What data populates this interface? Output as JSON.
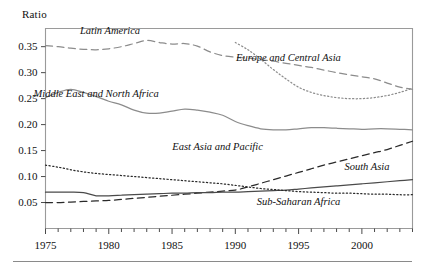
{
  "axis_title": "Ratio",
  "chart_data": {
    "type": "line",
    "title": "",
    "xlabel": "",
    "ylabel": "Ratio",
    "xlim": [
      1975,
      2004
    ],
    "ylim": [
      0.0,
      0.385
    ],
    "yticks": [
      0.05,
      0.1,
      0.15,
      0.2,
      0.25,
      0.3,
      0.35
    ],
    "ytick_labels": [
      "0.05",
      "0.10",
      "0.15",
      "0.20",
      "0.25",
      "0.30",
      "0.35"
    ],
    "xticks": [
      1975,
      1980,
      1985,
      1990,
      1995,
      2000
    ],
    "xtick_labels": [
      "1975",
      "1980",
      "1985",
      "1990",
      "1995",
      "2000"
    ],
    "minor_xticks_every": 1,
    "grid": false,
    "legend": "inline-annotations",
    "series": [
      {
        "name": "Latin America",
        "style": "dashed",
        "color": "#8c8c8c",
        "label_pos": {
          "x": 1980.1,
          "y": 0.374
        },
        "x": [
          1975,
          1976,
          1977,
          1978,
          1979,
          1980,
          1981,
          1982,
          1983,
          1984,
          1985,
          1986,
          1987,
          1988,
          1989,
          1990,
          1991,
          1992,
          1993,
          1994,
          1995,
          1996,
          1997,
          1998,
          1999,
          2000,
          2001,
          2002,
          2003,
          2004
        ],
        "values": [
          0.352,
          0.35,
          0.347,
          0.345,
          0.344,
          0.346,
          0.35,
          0.356,
          0.362,
          0.358,
          0.355,
          0.356,
          0.351,
          0.34,
          0.333,
          0.33,
          0.328,
          0.325,
          0.322,
          0.318,
          0.314,
          0.31,
          0.305,
          0.3,
          0.296,
          0.292,
          0.288,
          0.28,
          0.272,
          0.268
        ]
      },
      {
        "name": "Middle East and North Africa",
        "style": "solid",
        "color": "#8c8c8c",
        "label_pos": {
          "x": 1979.0,
          "y": 0.253
        },
        "x": [
          1975,
          1976,
          1977,
          1978,
          1979,
          1980,
          1981,
          1982,
          1983,
          1984,
          1985,
          1986,
          1987,
          1988,
          1989,
          1990,
          1991,
          1992,
          1993,
          1994,
          1995,
          1996,
          1997,
          1998,
          1999,
          2000,
          2001,
          2002,
          2003,
          2004
        ],
        "values": [
          0.252,
          0.262,
          0.268,
          0.262,
          0.254,
          0.245,
          0.238,
          0.228,
          0.222,
          0.222,
          0.226,
          0.23,
          0.228,
          0.224,
          0.218,
          0.206,
          0.198,
          0.192,
          0.19,
          0.19,
          0.192,
          0.194,
          0.194,
          0.193,
          0.192,
          0.191,
          0.192,
          0.192,
          0.191,
          0.19
        ]
      },
      {
        "name": "Europe and Central Asia",
        "style": "dotted",
        "color": "#8c8c8c",
        "label_pos": {
          "x": 1994.2,
          "y": 0.322
        },
        "x": [
          1990,
          1991,
          1992,
          1993,
          1994,
          1995,
          1996,
          1997,
          1998,
          1999,
          2000,
          2001,
          2002,
          2003,
          2004
        ],
        "values": [
          0.358,
          0.344,
          0.326,
          0.306,
          0.288,
          0.272,
          0.262,
          0.256,
          0.252,
          0.25,
          0.25,
          0.252,
          0.256,
          0.262,
          0.27
        ]
      },
      {
        "name": "East Asia and Pacific",
        "style": "dashed",
        "color": "#2a2a2a",
        "label_pos": {
          "x": 1988.6,
          "y": 0.152
        },
        "x": [
          1975,
          1976,
          1977,
          1978,
          1979,
          1980,
          1981,
          1982,
          1983,
          1984,
          1985,
          1986,
          1987,
          1988,
          1989,
          1990,
          1991,
          1992,
          1993,
          1994,
          1995,
          1996,
          1997,
          1998,
          1999,
          2000,
          2001,
          2002,
          2003,
          2004
        ],
        "values": [
          0.05,
          0.05,
          0.051,
          0.052,
          0.053,
          0.054,
          0.056,
          0.058,
          0.06,
          0.062,
          0.064,
          0.066,
          0.068,
          0.07,
          0.072,
          0.074,
          0.08,
          0.087,
          0.094,
          0.101,
          0.108,
          0.115,
          0.122,
          0.128,
          0.134,
          0.14,
          0.146,
          0.152,
          0.16,
          0.168
        ]
      },
      {
        "name": "South Asia",
        "style": "solid",
        "color": "#4a4a4a",
        "label_pos": {
          "x": 2000.4,
          "y": 0.113
        },
        "x": [
          1975,
          1976,
          1977,
          1978,
          1979,
          1980,
          1981,
          1982,
          1983,
          1984,
          1985,
          1986,
          1987,
          1988,
          1989,
          1990,
          1991,
          1992,
          1993,
          1994,
          1995,
          1996,
          1997,
          1998,
          1999,
          2000,
          2001,
          2002,
          2003,
          2004
        ],
        "values": [
          0.07,
          0.07,
          0.07,
          0.069,
          0.063,
          0.063,
          0.064,
          0.065,
          0.066,
          0.067,
          0.068,
          0.068,
          0.069,
          0.069,
          0.07,
          0.07,
          0.071,
          0.072,
          0.073,
          0.074,
          0.076,
          0.078,
          0.08,
          0.082,
          0.084,
          0.086,
          0.088,
          0.09,
          0.092,
          0.094
        ]
      },
      {
        "name": "Sub-Saharan Africa",
        "style": "dotted",
        "color": "#2a2a2a",
        "label_pos": {
          "x": 1995.0,
          "y": 0.045
        },
        "x": [
          1975,
          1976,
          1977,
          1978,
          1979,
          1980,
          1981,
          1982,
          1983,
          1984,
          1985,
          1986,
          1987,
          1988,
          1989,
          1990,
          1991,
          1992,
          1993,
          1994,
          1995,
          1996,
          1997,
          1998,
          1999,
          2000,
          2001,
          2002,
          2003,
          2004
        ],
        "values": [
          0.122,
          0.118,
          0.113,
          0.109,
          0.106,
          0.104,
          0.102,
          0.1,
          0.098,
          0.096,
          0.094,
          0.092,
          0.09,
          0.088,
          0.086,
          0.083,
          0.08,
          0.077,
          0.075,
          0.073,
          0.071,
          0.07,
          0.069,
          0.068,
          0.068,
          0.067,
          0.066,
          0.066,
          0.065,
          0.065
        ]
      }
    ]
  }
}
